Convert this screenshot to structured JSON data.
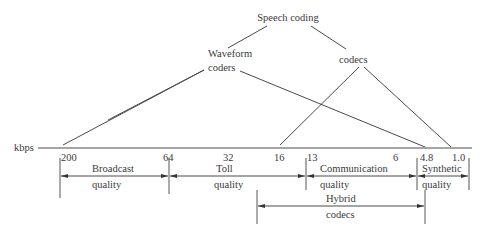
{
  "diagram": {
    "root": "Speech coding",
    "branches": [
      {
        "line1": "Waveform",
        "line2": "coders"
      },
      {
        "line1": "codecs"
      }
    ],
    "axis": {
      "unit_label": "kbps",
      "ticks": [
        "200",
        "64",
        "32",
        "16",
        "13",
        "6",
        "4.8",
        "1.0"
      ]
    },
    "quality_ranges": [
      {
        "line1": "Broadcast",
        "line2": "quality"
      },
      {
        "line1": "Toll",
        "line2": "quality"
      },
      {
        "line1": "Communication",
        "line2": "quality"
      },
      {
        "line1": "Synthetic",
        "line2": "quality"
      }
    ],
    "hybrid": {
      "line1": "Hybrid",
      "line2": "codecs"
    },
    "colors": {
      "line": "#4a4a4a",
      "text": "#3a3a3a",
      "background": "#ffffff"
    }
  }
}
